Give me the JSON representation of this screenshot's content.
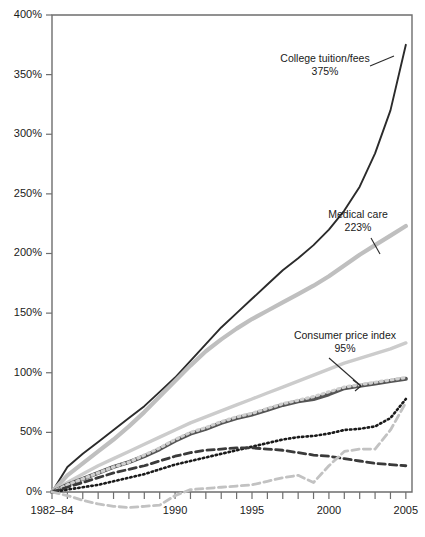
{
  "chart_data": {
    "type": "line",
    "title": "",
    "xlabel": "",
    "ylabel": "",
    "xlim": [
      1982,
      2005.5
    ],
    "ylim": [
      -15,
      400
    ],
    "grid": false,
    "legend": "annotations-inline",
    "y_ticks": [
      "0%",
      "50%",
      "100%",
      "150%",
      "200%",
      "250%",
      "300%",
      "350%",
      "400%"
    ],
    "y_tick_values": [
      0,
      50,
      100,
      150,
      200,
      250,
      300,
      350,
      400
    ],
    "x_ticks": [
      "1982–84",
      "1990",
      "1995",
      "2000",
      "2005"
    ],
    "x_tick_values": [
      1982,
      1990,
      1995,
      2000,
      2005
    ],
    "x_minor_ticks": [
      1983,
      1984,
      1985,
      1986,
      1987,
      1988,
      1989,
      1991,
      1992,
      1993,
      1994,
      1996,
      1997,
      1998,
      1999,
      2001,
      2002,
      2003,
      2004
    ],
    "x": [
      1982,
      1983,
      1984,
      1985,
      1986,
      1987,
      1988,
      1989,
      1990,
      1991,
      1992,
      1993,
      1994,
      1995,
      1996,
      1997,
      1998,
      1999,
      2000,
      2001,
      2002,
      2003,
      2004,
      2005
    ],
    "series": [
      {
        "name": "College tuition/fees",
        "end_label": "375%",
        "color": "#2b2b2b",
        "width": 1.9,
        "style": "solid",
        "values": [
          0,
          21,
          32,
          42,
          52,
          62,
          72,
          84,
          96,
          110,
          124,
          138,
          150,
          162,
          174,
          186,
          196,
          207,
          220,
          236,
          256,
          284,
          320,
          375
        ]
      },
      {
        "name": "Medical care",
        "end_label": "223%",
        "color": "#bfbfbf",
        "width": 4.2,
        "style": "solid",
        "values": [
          0,
          14,
          24,
          34,
          44,
          55,
          67,
          80,
          93,
          106,
          118,
          128,
          137,
          145,
          152,
          159,
          166,
          173,
          181,
          190,
          199,
          207,
          215,
          223
        ]
      },
      {
        "name": "Upper light reference",
        "end_label": "125%",
        "color": "#cccccc",
        "width": 3.4,
        "style": "solid",
        "values": [
          0,
          8,
          15,
          22,
          28,
          34,
          40,
          46,
          52,
          58,
          63,
          68,
          73,
          78,
          83,
          88,
          93,
          98,
          103,
          108,
          112,
          116,
          120,
          125
        ]
      },
      {
        "name": "Consumer price index",
        "end_label": "95%",
        "color": "#555555",
        "width": 4.0,
        "style": "solid",
        "values": [
          0,
          6,
          11,
          16,
          21,
          25,
          30,
          36,
          43,
          49,
          53,
          58,
          62,
          65,
          69,
          73,
          76,
          78,
          82,
          87,
          89,
          91,
          93,
          95
        ]
      },
      {
        "name": "Light dotted overlay",
        "end_label": "96%",
        "color": "#cfcfcf",
        "width": 3.2,
        "style": "dotted",
        "values": [
          0,
          6,
          11,
          16,
          21,
          25,
          31,
          37,
          44,
          50,
          54,
          59,
          63,
          66,
          70,
          74,
          77,
          80,
          84,
          88,
          90,
          92,
          94,
          96
        ]
      },
      {
        "name": "Black dotted series",
        "end_label": "78%",
        "color": "#1a1a1a",
        "width": 2.6,
        "style": "dotted",
        "values": [
          0,
          2,
          4,
          6,
          9,
          12,
          15,
          19,
          23,
          26,
          29,
          32,
          35,
          38,
          41,
          44,
          46,
          47,
          49,
          52,
          53,
          55,
          62,
          78
        ]
      },
      {
        "name": "Dark dashed series",
        "end_label": "22%",
        "color": "#3a3a3a",
        "width": 2.8,
        "style": "dashed",
        "values": [
          0,
          4,
          8,
          12,
          16,
          19,
          22,
          26,
          30,
          33,
          35,
          36,
          37,
          37,
          36,
          35,
          33,
          31,
          30,
          28,
          26,
          24,
          23,
          22
        ]
      },
      {
        "name": "Light gray dashed energy series",
        "end_label": "75%",
        "color": "#c2c2c2",
        "width": 2.8,
        "style": "dashed",
        "values": [
          0,
          -3,
          -7,
          -10,
          -12,
          -13,
          -12,
          -11,
          -3,
          2,
          3,
          4,
          5,
          6,
          9,
          12,
          14,
          8,
          22,
          34,
          36,
          36,
          52,
          75
        ]
      }
    ],
    "annotations": [
      {
        "label": "College tuition/fees",
        "value": "375%",
        "x": 325,
        "y": 62
      },
      {
        "label": "Medical care",
        "value": "223%",
        "x": 358,
        "y": 218
      },
      {
        "label": "Consumer price index",
        "value": "95%",
        "x": 345,
        "y": 339
      }
    ]
  }
}
